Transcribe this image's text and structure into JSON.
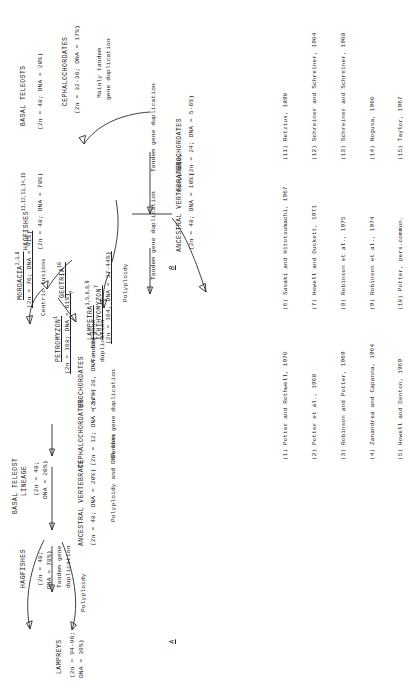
{
  "figure": {
    "panel_a": {
      "letter": "A",
      "nodes": [
        {
          "name": "LAMPREYS",
          "karyotype": "(2n = 94-96;",
          "dna": "DNA = 39%)"
        },
        {
          "name": "HAGFISHES",
          "karyotype": "(2n = 48;",
          "dna": "DNA = 78%)"
        },
        {
          "name": "BASAL TELEOST",
          "name2": "LINEAGE",
          "karyotype": "(2n = 48;",
          "dna": "DNA = 20%)"
        },
        {
          "name": "ANCESTRAL VERTEBRATE",
          "karyotype": "(2n = 48; DNA = 20%)"
        },
        {
          "name": "CEPHALOCHORDATES",
          "karyotype": "(2n = 12; DNA = 17%)"
        },
        {
          "name": "UROCHORDATES",
          "karyotype": "(2n = 28, DNA = 6%)"
        }
      ],
      "process_labels": [
        "Polyploidy",
        "Tandem gene",
        "duplication",
        "Tandem gene",
        "duplication",
        "Polyploidy and DNA loss",
        "Tandem gene duplication"
      ]
    },
    "panel_b": {
      "letter": "B",
      "nodes": [
        {
          "name": "PETROMYZON",
          "sup": "1",
          "karyotype": "(2n = 168;",
          "dna": "DNA = 61%)"
        },
        {
          "name": "MORDACIA",
          "sup": "2,3,8",
          "karyotype": "(2n = 76;",
          "dna": "DNA = 41%)"
        },
        {
          "name": "LAMPETRA",
          "sup": "3,5,6,8,9"
        },
        {
          "name": "ICHTHYOMYZON",
          "sup": "7",
          "karyotype": "(2n = 164,",
          "dna": "DNA = 37-44%)"
        },
        {
          "name": "GEOTRIA",
          "sup": "10"
        },
        {
          "name": "HAGFISHES",
          "sup": "11,12,13,14,15",
          "karyotype": "(2n = 48;",
          "dna": "DNA = 78%)"
        },
        {
          "name": "BASAL TELEOSTS",
          "karyotype": "(2n = 48;",
          "dna": "DNA = 20%)"
        },
        {
          "name": "ANCESTRAL VERTEBRATES",
          "karyotype": "(2n = 48; DNA = 10%)"
        },
        {
          "name": "CEPHALOCHORDATES",
          "karyotype": "(2n = 32-36; DNA = 17%)"
        },
        {
          "name": "UROCHORDATES",
          "karyotype": "(2n = 24; DNA = 5-6%)"
        }
      ],
      "process_labels": [
        "Tandem gene",
        "duplication",
        "Centric fusions",
        "?",
        "Polyploidy",
        "Tandem gene duplication",
        "Tandem gene duplication",
        "Polyploidy",
        "Mainly tandem",
        "gene duplication"
      ]
    },
    "references": {
      "column1": [
        "(1) Potter and Rothwell, 1970",
        "(2) Potter et al., 1968",
        "(3) Robinson and Potter, 1969",
        "(4) Zanandrea and Capanna, 1964",
        "(5) Howell and Denton, 1969"
      ],
      "column2": [
        "(6) Sasaki and Hitotsumachi, 1967",
        "(7) Howell and Duckett, 1971",
        "(8) Robinson et al., 1975",
        "(9) Robinson et al., 1974",
        "(10) Potter, pers.commun."
      ],
      "column3": [
        "(11) Retzius, 1890",
        "(12) Schreiner and Schreiner, 1904",
        "(13) Schreiner and Schreiner, 1908",
        "(14) Nogusa, 1960",
        "(15) Taylor, 1967"
      ]
    }
  }
}
